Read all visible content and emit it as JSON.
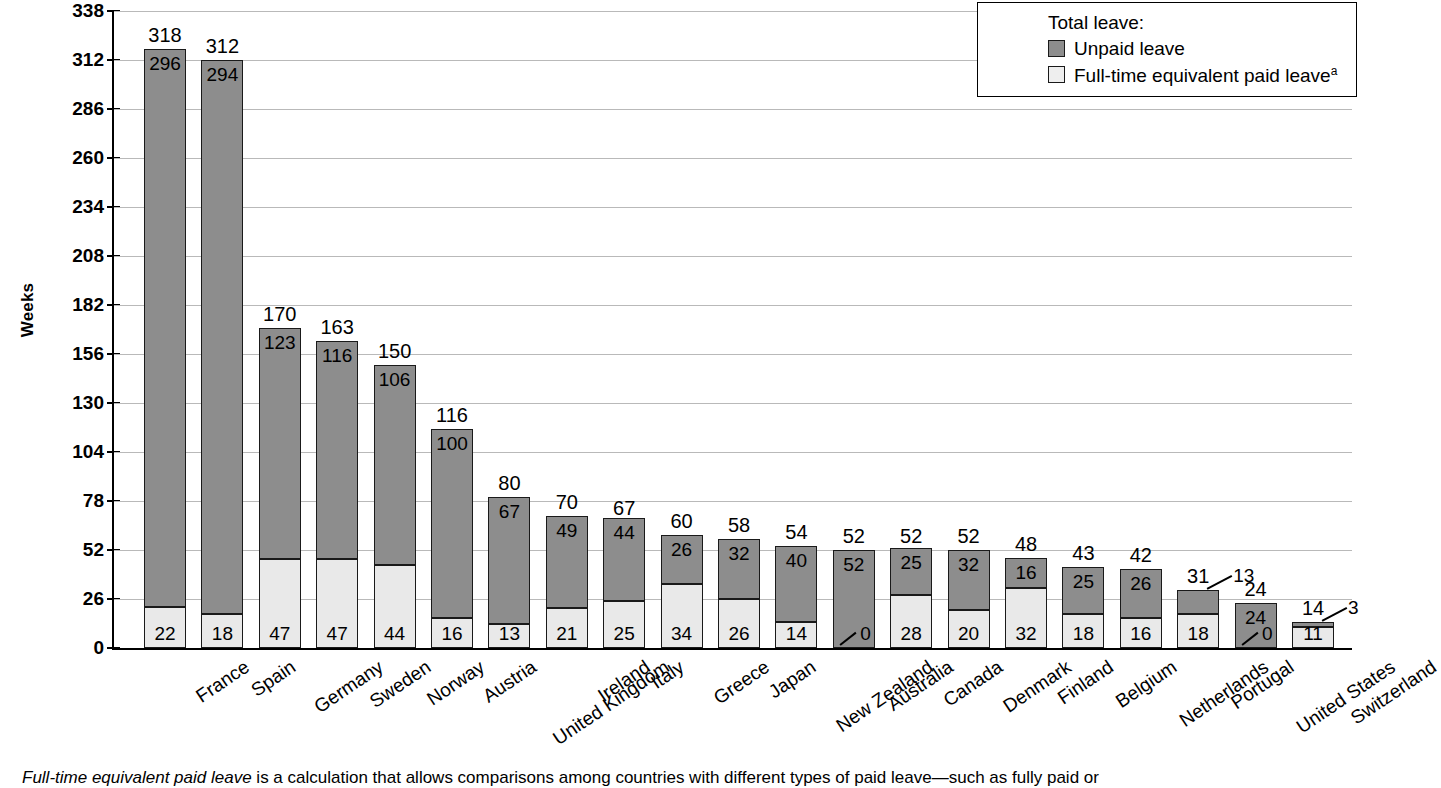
{
  "chart_data": {
    "type": "bar",
    "stacked": true,
    "title": "",
    "xlabel": "",
    "ylabel": "Weeks",
    "ylim": [
      0,
      338
    ],
    "yticks": [
      0,
      26,
      52,
      78,
      104,
      130,
      156,
      182,
      208,
      234,
      260,
      286,
      312,
      338
    ],
    "grid": true,
    "legend_position": "top-right",
    "categories": [
      "France",
      "Spain",
      "Germany",
      "Sweden",
      "Norway",
      "Austria",
      "United Kingdom",
      "Ireland",
      "Italy",
      "Greece",
      "Japan",
      "New Zealand",
      "Australia",
      "Canada",
      "Denmark",
      "Finland",
      "Belgium",
      "Netherlands",
      "Portugal",
      "United States",
      "Switzerland"
    ],
    "series": [
      {
        "name": "Full-time equivalent paid leave",
        "values": [
          22,
          18,
          47,
          47,
          44,
          16,
          13,
          21,
          25,
          34,
          26,
          14,
          0,
          28,
          20,
          32,
          18,
          16,
          18,
          0,
          11
        ]
      },
      {
        "name": "Unpaid leave",
        "values": [
          296,
          294,
          123,
          116,
          106,
          100,
          67,
          49,
          44,
          26,
          32,
          40,
          52,
          25,
          32,
          16,
          25,
          26,
          13,
          24,
          3
        ]
      }
    ],
    "totals": [
      318,
      312,
      170,
      163,
      150,
      116,
      80,
      70,
      67,
      60,
      58,
      54,
      52,
      52,
      52,
      48,
      43,
      42,
      31,
      24,
      14
    ]
  },
  "legend": {
    "title": "Total leave:",
    "entries": [
      {
        "label": "Unpaid leave",
        "color": "#8d8d8d"
      },
      {
        "label": "Full-time equivalent paid leave",
        "superscript": "a",
        "color": "#eeeeee"
      }
    ]
  },
  "footnote": {
    "italic_lead": "Full-time equivalent paid leave",
    "rest": " is a calculation that allows comparisons among countries with different types of paid leave—such as fully paid or"
  }
}
